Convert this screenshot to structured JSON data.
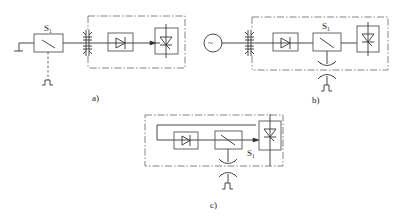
{
  "diagrams": [
    {
      "id": "a",
      "caption": "a)",
      "switch_label": "S",
      "switch_sub": "1",
      "elements": [
        "ground",
        "switch S1",
        "pulse control",
        "transformer/filter",
        "rectifier diode",
        "thyristor/triac load"
      ],
      "boundary": "dash-dot enclosure"
    },
    {
      "id": "b",
      "caption": "b)",
      "switch_label": "S",
      "switch_sub": "1",
      "source_symbol": "~",
      "elements": [
        "AC source",
        "transformer/filter",
        "rectifier diode",
        "switch S1",
        "thyristor/triac load",
        "coupling",
        "pulse control"
      ],
      "boundary": "dash-dot enclosure"
    },
    {
      "id": "c",
      "caption": "c)",
      "switch_label": "S",
      "switch_sub": "1",
      "elements": [
        "feedback loop",
        "rectifier diode",
        "switch S1",
        "thyristor/triac load",
        "coupling",
        "pulse control"
      ],
      "boundary": "dash-dot enclosure"
    }
  ]
}
